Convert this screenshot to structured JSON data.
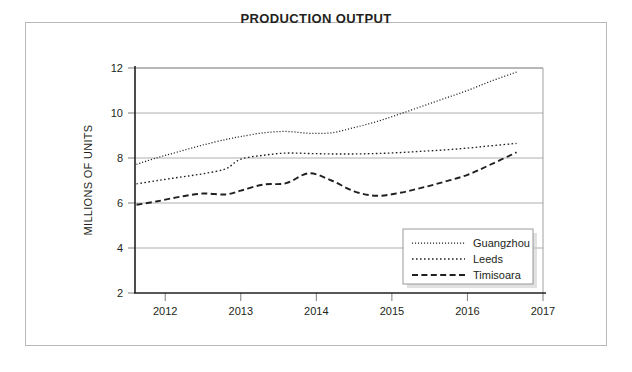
{
  "figure": {
    "title": "PRODUCTION OUTPUT"
  },
  "chart_data": {
    "type": "line",
    "title": "PRODUCTION OUTPUT",
    "xlabel": "",
    "ylabel": "MILLIONS OF UNITS",
    "xlim": [
      2011.6,
      2017.0
    ],
    "ylim": [
      2,
      12
    ],
    "xticks": [
      2012,
      2013,
      2014,
      2015,
      2016,
      2017
    ],
    "xtick_labels": [
      "2012",
      "2013",
      "2014",
      "2015",
      "2016",
      "2017"
    ],
    "yticks": [
      2,
      4,
      6,
      8,
      10,
      12
    ],
    "ytick_labels": [
      "2",
      "4",
      "6",
      "8",
      "10",
      "12"
    ],
    "grid": "horizontal",
    "legend_position": "lower-right",
    "x": [
      2011.62,
      2011.9,
      2012.2,
      2012.5,
      2012.8,
      2013.0,
      2013.3,
      2013.6,
      2013.9,
      2014.2,
      2014.5,
      2014.8,
      2015.1,
      2015.4,
      2015.7,
      2016.0,
      2016.3,
      2016.65
    ],
    "series": [
      {
        "name": "Guangzhou",
        "style": "fine-dotted",
        "color": "#231f20",
        "values": [
          7.72,
          8.02,
          8.3,
          8.58,
          8.82,
          8.95,
          9.12,
          9.18,
          9.1,
          9.12,
          9.35,
          9.62,
          9.95,
          10.3,
          10.65,
          11.0,
          11.4,
          11.82
        ]
      },
      {
        "name": "Leeds",
        "style": "dotted",
        "color": "#231f20",
        "values": [
          6.85,
          7.0,
          7.15,
          7.3,
          7.52,
          7.95,
          8.12,
          8.22,
          8.2,
          8.18,
          8.18,
          8.2,
          8.24,
          8.3,
          8.36,
          8.44,
          8.54,
          8.65
        ]
      },
      {
        "name": "Timisoara",
        "style": "dashed",
        "color": "#231f20",
        "values": [
          5.92,
          6.08,
          6.28,
          6.42,
          6.38,
          6.55,
          6.82,
          6.88,
          7.32,
          7.0,
          6.52,
          6.32,
          6.45,
          6.68,
          6.95,
          7.25,
          7.7,
          8.25
        ]
      }
    ]
  }
}
